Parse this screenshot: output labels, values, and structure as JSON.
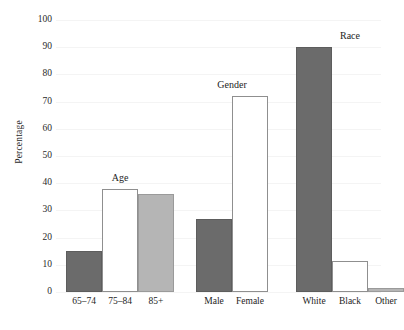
{
  "chart_data": {
    "type": "bar",
    "title": "",
    "xlabel": "",
    "ylabel": "Percentage",
    "ylim": [
      0,
      100
    ],
    "ytick_step": 10,
    "yticks": [
      100,
      90,
      80,
      70,
      60,
      50,
      40,
      30,
      20,
      10,
      0
    ],
    "grid": true,
    "legend": "none",
    "categories": [
      "65–74",
      "75–84",
      "85+",
      "Male",
      "Female",
      "White",
      "Black",
      "Other"
    ],
    "values": [
      15,
      38,
      36,
      27,
      72,
      90,
      11.5,
      1.5
    ],
    "groups": [
      {
        "name": "Age",
        "label": "Age",
        "bars": [
          {
            "category": "65–74",
            "value": 15,
            "fill": "dark"
          },
          {
            "category": "75–84",
            "value": 38,
            "fill": "white"
          },
          {
            "category": "85+",
            "value": 36,
            "fill": "light"
          }
        ]
      },
      {
        "name": "Gender",
        "label": "Gender",
        "bars": [
          {
            "category": "Male",
            "value": 27,
            "fill": "dark"
          },
          {
            "category": "Female",
            "value": 72,
            "fill": "white"
          }
        ]
      },
      {
        "name": "Race",
        "label": "Race",
        "bars": [
          {
            "category": "White",
            "value": 90,
            "fill": "dark"
          },
          {
            "category": "Black",
            "value": 11.5,
            "fill": "white"
          },
          {
            "category": "Other",
            "value": 1.5,
            "fill": "light"
          }
        ]
      }
    ],
    "colors": {
      "fill_dark": "#6b6b6b",
      "fill_white": "#ffffff",
      "fill_light": "#b5b5b5",
      "bar_border": "#8a8a8a",
      "gridline": "#f4f4f4",
      "text": "#1d1d1d",
      "background": "#ffffff"
    }
  },
  "layout": {
    "plot_left": 56,
    "plot_top": 20,
    "plot_width": 325,
    "plot_height": 272,
    "bar_width": 36,
    "group_x_starts": [
      10,
      140,
      240
    ],
    "group_gap": 2
  }
}
